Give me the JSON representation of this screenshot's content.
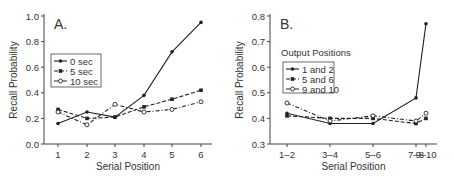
{
  "chart_data": [
    {
      "type": "line",
      "panel_label": "A.",
      "xlabel": "Serial Position",
      "ylabel": "Recall Probability",
      "categories": [
        "1",
        "2",
        "3",
        "4",
        "5",
        "6"
      ],
      "ylim": [
        0.0,
        1.0
      ],
      "yticks": [
        "0.0",
        "0.2",
        "0.4",
        "0.6",
        "0.8",
        "1.0"
      ],
      "legend_title": "",
      "legend_position": "upper-left",
      "grid": false,
      "series": [
        {
          "name": "0 sec",
          "style": "solid",
          "marker": "filled-circle",
          "values": [
            0.16,
            0.25,
            0.21,
            0.38,
            0.72,
            0.95
          ]
        },
        {
          "name": "5 sec",
          "style": "dashed",
          "marker": "filled-square",
          "values": [
            0.27,
            0.2,
            0.21,
            0.29,
            0.35,
            0.42
          ]
        },
        {
          "name": "10 sec",
          "style": "dash-dot",
          "marker": "open-circle",
          "values": [
            0.25,
            0.15,
            0.31,
            0.25,
            0.27,
            0.33
          ]
        }
      ]
    },
    {
      "type": "line",
      "panel_label": "B.",
      "xlabel": "Serial Position",
      "ylabel": "Recall Probability",
      "categories": [
        "1–2",
        "3–4",
        "5–6",
        "7–8",
        "9–10"
      ],
      "ylim": [
        0.3,
        0.8
      ],
      "yticks": [
        "0.3",
        "0.4",
        "0.5",
        "0.6",
        "0.7",
        "0.8"
      ],
      "legend_title": "Output Positions",
      "legend_position": "upper-left",
      "grid": false,
      "series": [
        {
          "name": "1 and 2",
          "style": "solid",
          "marker": "filled-circle",
          "values": [
            0.42,
            0.38,
            0.38,
            0.48,
            0.77
          ]
        },
        {
          "name": "5 and 6",
          "style": "dashed",
          "marker": "filled-square",
          "values": [
            0.41,
            0.4,
            0.4,
            0.38,
            0.4
          ]
        },
        {
          "name": "9 and 10",
          "style": "dash-dot",
          "marker": "open-circle",
          "values": [
            0.46,
            0.39,
            0.41,
            0.39,
            0.42
          ]
        }
      ]
    }
  ]
}
